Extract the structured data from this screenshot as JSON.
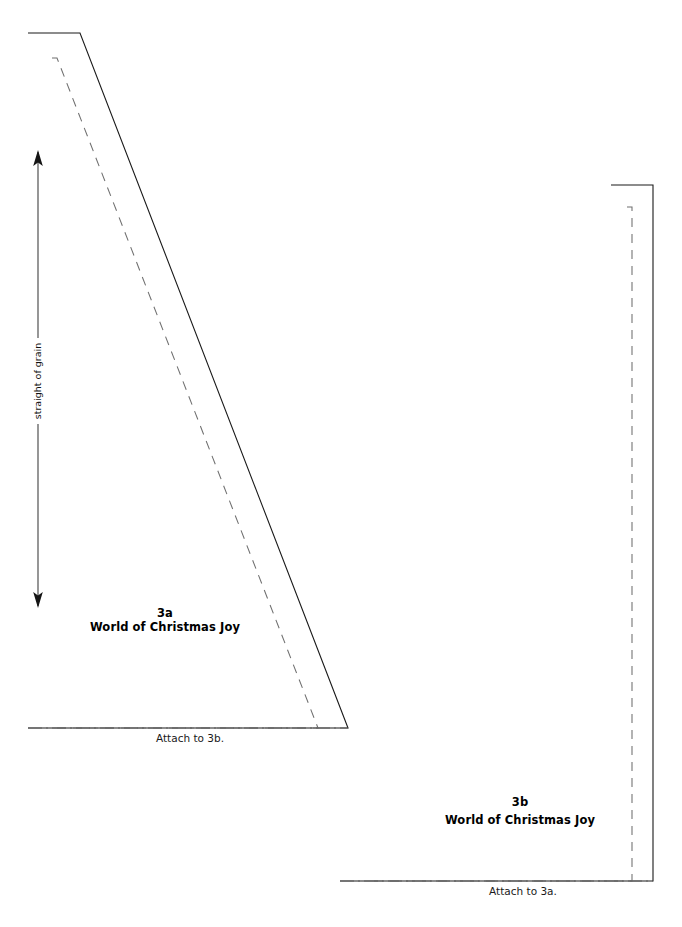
{
  "document": {
    "type": "sewing-pattern-template",
    "background_color": "#ffffff",
    "ink_color": "#1a1a1a",
    "width": 682,
    "height": 927
  },
  "pieces": [
    {
      "id": "3a",
      "number_label": "3a",
      "title_label": "World of Christmas Joy",
      "attach_label": "Attach to 3b.",
      "orientation": "left-straight-edge",
      "cut_line_color": "#1a1a1a",
      "seam_line_color": "#6f6f6f",
      "fold_line_color": "#5e5e5e",
      "outline_points": "28,33 80,33 348,728 28,728",
      "seam_points": "52,58 57,58 318,728 52,728",
      "fold_points": "28,728 348,728",
      "label_x": 165,
      "label_y_number": 617,
      "label_y_title": 631,
      "attach_x": 190,
      "attach_y": 742
    },
    {
      "id": "3b",
      "number_label": "3b",
      "title_label": "World of Christmas Joy",
      "attach_label": "Attach to 3a.",
      "orientation": "right-straight-edge",
      "cut_line_color": "#1a1a1a",
      "seam_line_color": "#6f6f6f",
      "fold_line_color": "#5e5e5e",
      "outline_points": "611,185 653,185 653,881 340,881",
      "seam_points": "627,207 632,207 632,881 370,881",
      "fold_points": "340,881 653,881",
      "label_x": 520,
      "label_y_number": 806,
      "label_y_title": 824,
      "attach_x": 523,
      "attach_y": 895
    }
  ],
  "grain_marker": {
    "label": "straight of grain",
    "axis_x": 38,
    "top_y": 152,
    "bottom_y": 606,
    "label_center_y": 380,
    "arrow_color": "#151515",
    "line_color": "#4a4a4a",
    "double_headed": true
  },
  "line_legend": {
    "cut_line": "solid cutting line",
    "seam_line": "dashed stitching line",
    "fold_line": "dash-dot attach/fold line",
    "grain_arrow": "double-headed grain arrow"
  }
}
